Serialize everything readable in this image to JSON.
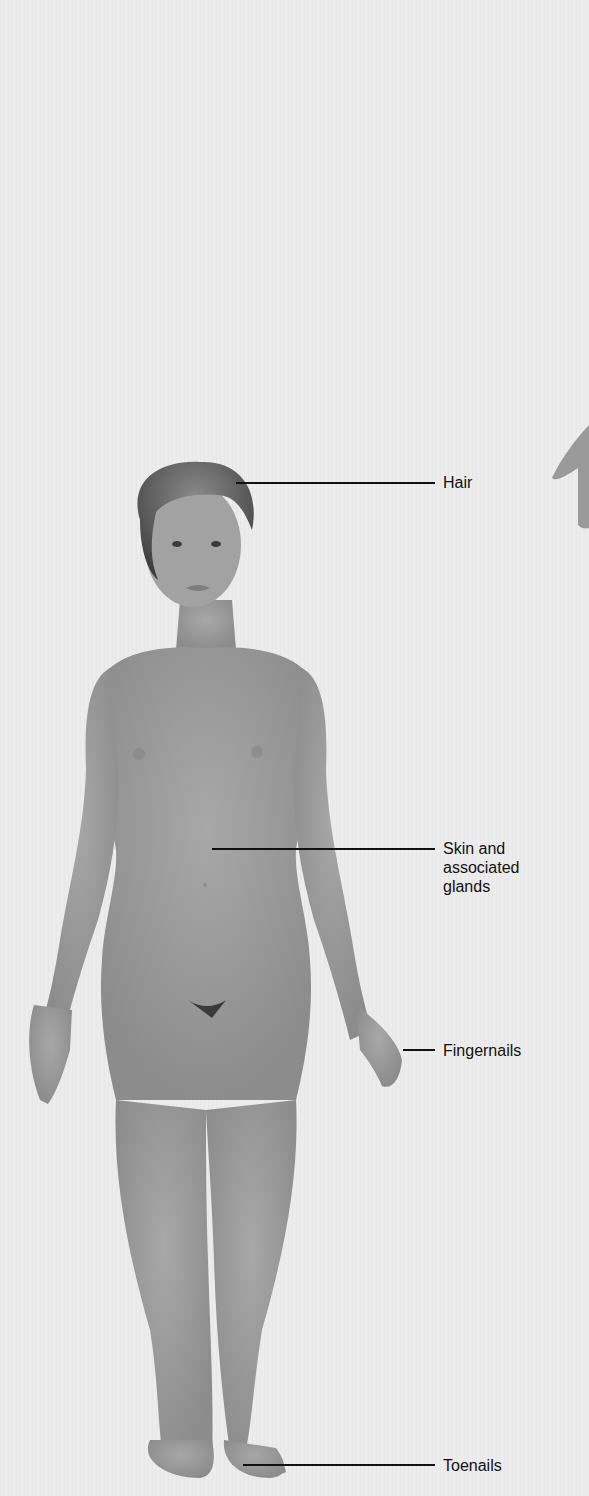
{
  "diagram": {
    "colors": {
      "background": "#ececec",
      "skin": "#9c9c9c",
      "hair": "#5a5a5a",
      "leader_line": "#111111",
      "label_text": "#111111"
    },
    "labels": [
      {
        "id": "hair",
        "text": "Hair"
      },
      {
        "id": "skin",
        "text": "Skin and\nassociated\nglands"
      },
      {
        "id": "fingernails",
        "text": "Fingernails"
      },
      {
        "id": "toenails",
        "text": "Toenails"
      }
    ]
  }
}
